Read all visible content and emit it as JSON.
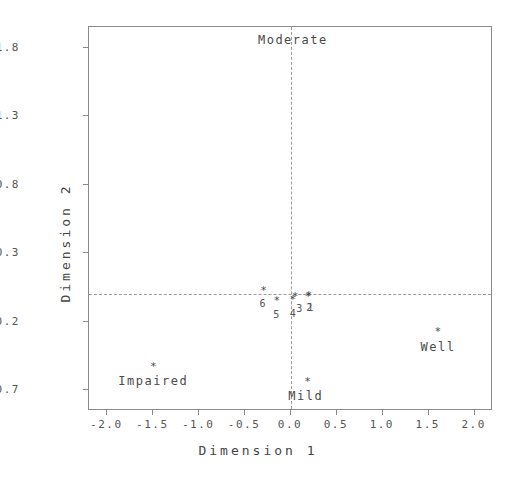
{
  "chart_data": {
    "type": "scatter",
    "title": "",
    "xlabel": "Dimension 1",
    "ylabel": "Dimension 2",
    "xlim": [
      -2.2,
      2.2
    ],
    "ylim": [
      -0.85,
      1.95
    ],
    "xticks": [
      "-2.0",
      "-1.5",
      "-1.0",
      "-0.5",
      "0.0",
      "0.5",
      "1.0",
      "1.5",
      "2.0"
    ],
    "xtick_values": [
      -2.0,
      -1.5,
      -1.0,
      -0.5,
      0.0,
      0.5,
      1.0,
      1.5,
      2.0
    ],
    "yticks": [
      "1.8",
      "1.3",
      "0.8",
      "0.3",
      "-0.2",
      "-0.7"
    ],
    "ytick_values": [
      1.8,
      1.3,
      0.8,
      0.3,
      -0.2,
      -0.7
    ],
    "grid": false,
    "reference_lines": [
      {
        "orientation": "vertical",
        "value": 0.0,
        "style": "dashed"
      },
      {
        "orientation": "horizontal",
        "value": 0.0,
        "style": "dashed"
      }
    ],
    "legend": "none",
    "marker_symbol": "*",
    "series": [
      {
        "name": "Column points (groups)",
        "points": [
          {
            "label": "Moderate",
            "x": 0.02,
            "y": 1.97,
            "label_dx": 0.0,
            "label_dy": -0.07
          },
          {
            "label": "Well",
            "x": 1.6,
            "y": -0.27,
            "label_dx": 0.0,
            "label_dy": -0.07
          },
          {
            "label": "Impaired",
            "x": -1.5,
            "y": -0.52,
            "label_dx": 0.0,
            "label_dy": -0.07
          },
          {
            "label": "Mild",
            "x": 0.18,
            "y": -0.63,
            "label_dx": -0.02,
            "label_dy": -0.07
          }
        ]
      },
      {
        "name": "Row points (items)",
        "points": [
          {
            "label": "1",
            "x": 0.195,
            "y": -0.005,
            "label_dx": 0.015,
            "label_dy": -0.055
          },
          {
            "label": "2",
            "x": 0.185,
            "y": -0.01,
            "label_dx": 0.015,
            "label_dy": -0.055
          },
          {
            "label": "3",
            "x": 0.045,
            "y": -0.015,
            "label_dx": 0.045,
            "label_dy": -0.055
          },
          {
            "label": "4",
            "x": 0.02,
            "y": -0.035,
            "label_dx": 0.0,
            "label_dy": -0.07
          },
          {
            "label": "5",
            "x": -0.155,
            "y": -0.04,
            "label_dx": -0.005,
            "label_dy": -0.07
          },
          {
            "label": "6",
            "x": -0.3,
            "y": 0.03,
            "label_dx": -0.01,
            "label_dy": -0.065
          }
        ]
      }
    ]
  },
  "figure": {
    "background_color": "#ffffff",
    "frame_color": "#8a8a8a",
    "marker_color": "#4a4a4a",
    "text_color": "#555555",
    "refline_color": "#9a9a9a"
  }
}
